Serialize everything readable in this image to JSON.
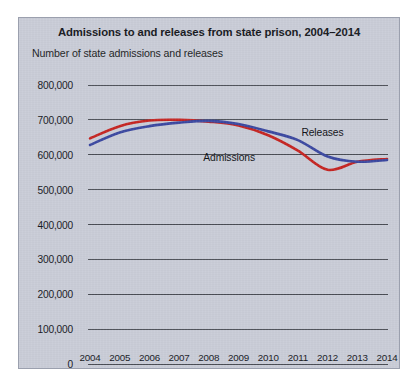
{
  "figure": {
    "title": "Admissions to and releases from state prison, 2004–2014",
    "subtitle": "Number of state admissions and releases",
    "panel_bg": "#c9ccd7",
    "panel_border": "#9ba0ae"
  },
  "labels": {
    "admissions": "Admissions",
    "releases": "Releases"
  },
  "colors": {
    "admissions": "#c52320",
    "releases": "#3a47a0",
    "gridline": "#4a4d55",
    "text": "#16181e"
  },
  "chart_data": {
    "type": "line",
    "title": "Admissions to and releases from state prison, 2004–2014",
    "subtitle": "Number of state admissions and releases",
    "xlabel": "",
    "ylabel": "Number of state admissions and releases",
    "categories": [
      "2004",
      "2005",
      "2006",
      "2007",
      "2008",
      "2009",
      "2010",
      "2011",
      "2012",
      "2013",
      "2014"
    ],
    "x": [
      2004,
      2005,
      2006,
      2007,
      2008,
      2009,
      2010,
      2011,
      2012,
      2013,
      2014
    ],
    "ylim": [
      0,
      800000
    ],
    "xlim": [
      2004,
      2014
    ],
    "y_ticks": [
      0,
      100000,
      200000,
      300000,
      400000,
      500000,
      600000,
      700000,
      800000
    ],
    "y_tick_labels": [
      "0",
      "100,000",
      "200,000",
      "300,000",
      "400,000",
      "500,000",
      "600,000",
      "700,000",
      "800,000"
    ],
    "grid": "horizontal",
    "legend": "inline-annotations",
    "series": [
      {
        "name": "Admissions",
        "color": "#c52320",
        "values": [
          647000,
          682000,
          698000,
          700000,
          695000,
          684000,
          656000,
          612000,
          557000,
          580000,
          588000
        ]
      },
      {
        "name": "Releases",
        "color": "#3a47a0",
        "values": [
          628000,
          664000,
          682000,
          692000,
          697000,
          688000,
          667000,
          642000,
          595000,
          580000,
          585000
        ]
      }
    ],
    "annotations": [
      {
        "text": "Releases",
        "series": "Releases",
        "x": 2011.05,
        "y_px_offset": -14
      },
      {
        "text": "Admissions",
        "series": "Admissions",
        "x": 2009.7,
        "y_px_offset": 20
      }
    ]
  }
}
